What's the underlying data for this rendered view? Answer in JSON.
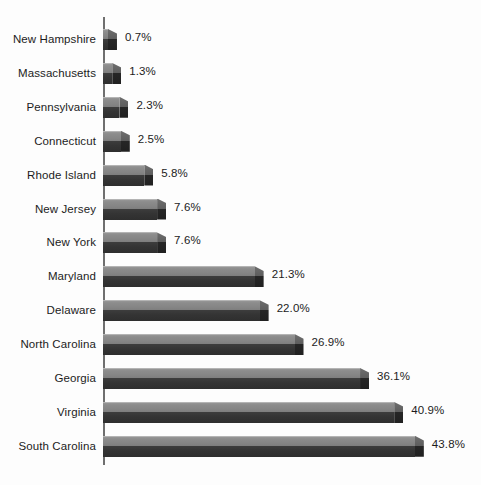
{
  "chart_data": {
    "type": "bar",
    "orientation": "horizontal",
    "title": "",
    "xlabel": "",
    "ylabel": "",
    "grid": false,
    "legend": null,
    "xlim": [
      0,
      43.8
    ],
    "value_suffix": "%",
    "categories": [
      "New Hampshire",
      "Massachusetts",
      "Pennsylvania",
      "Connecticut",
      "Rhode Island",
      "New Jersey",
      "New York",
      "Maryland",
      "Delaware",
      "North Carolina",
      "Georgia",
      "Virginia",
      "South Carolina"
    ],
    "values": [
      0.7,
      1.3,
      2.3,
      2.5,
      5.8,
      7.6,
      7.6,
      21.3,
      22.0,
      26.9,
      36.1,
      40.9,
      43.8
    ],
    "value_labels": [
      "0.7%",
      "1.3%",
      "2.3%",
      "2.5%",
      "5.8%",
      "7.6%",
      "7.6%",
      "21.3%",
      "22.0%",
      "26.9%",
      "36.1%",
      "40.9%",
      "43.8%"
    ]
  },
  "style": {
    "background": "#fdfdfd",
    "axis_color": "#6f6f6f",
    "bar_light": "#8c8c8c",
    "bar_dark": "#303030",
    "text_color": "#1c1c1c"
  }
}
